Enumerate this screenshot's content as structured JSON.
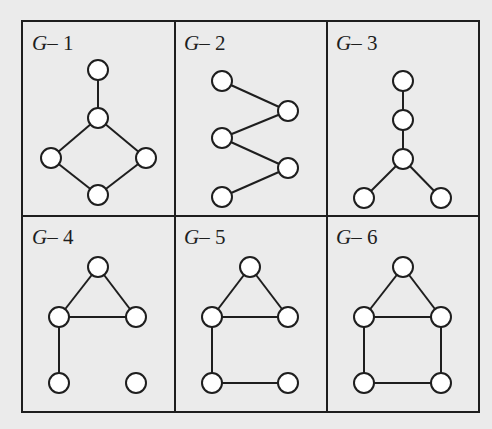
{
  "figure": {
    "grid": {
      "left": 22,
      "right": 479,
      "top": 21,
      "middle": 216,
      "bottom": 412,
      "col_dividers": [
        175,
        327
      ]
    },
    "node_radius": 10,
    "colors": {
      "background": "#ebebeb",
      "stroke": "#1e1e1e",
      "node_fill": "#ffffff"
    },
    "panels": [
      {
        "id": "G-1",
        "prefix": "G",
        "dash": "–",
        "number": "1",
        "label_pos": [
          32,
          50
        ],
        "nodes": [
          [
            98,
            70
          ],
          [
            98,
            118
          ],
          [
            51,
            158
          ],
          [
            146,
            158
          ],
          [
            98,
            195
          ]
        ],
        "edges": [
          [
            0,
            1
          ],
          [
            1,
            2
          ],
          [
            1,
            3
          ],
          [
            2,
            4
          ],
          [
            3,
            4
          ]
        ]
      },
      {
        "id": "G-2",
        "prefix": "G",
        "dash": "–",
        "number": "2",
        "label_pos": [
          184,
          50
        ],
        "nodes": [
          [
            222,
            81
          ],
          [
            288,
            111
          ],
          [
            222,
            138
          ],
          [
            288,
            168
          ],
          [
            222,
            197
          ]
        ],
        "edges": [
          [
            0,
            1
          ],
          [
            1,
            2
          ],
          [
            2,
            3
          ],
          [
            3,
            4
          ]
        ]
      },
      {
        "id": "G-3",
        "prefix": "G",
        "dash": "–",
        "number": "3",
        "label_pos": [
          336,
          50
        ],
        "nodes": [
          [
            403,
            81
          ],
          [
            403,
            120
          ],
          [
            403,
            159
          ],
          [
            364,
            198
          ],
          [
            441,
            198
          ]
        ],
        "edges": [
          [
            0,
            1
          ],
          [
            1,
            2
          ],
          [
            2,
            3
          ],
          [
            2,
            4
          ]
        ]
      },
      {
        "id": "G-4",
        "prefix": "G",
        "dash": "–",
        "number": "4",
        "label_pos": [
          32,
          244
        ],
        "nodes": [
          [
            98,
            267
          ],
          [
            59,
            317
          ],
          [
            136,
            317
          ],
          [
            59,
            383
          ],
          [
            136,
            383
          ]
        ],
        "edges": [
          [
            0,
            1
          ],
          [
            0,
            2
          ],
          [
            1,
            2
          ],
          [
            1,
            3
          ]
        ]
      },
      {
        "id": "G-5",
        "prefix": "G",
        "dash": "–",
        "number": "5",
        "label_pos": [
          184,
          244
        ],
        "nodes": [
          [
            250,
            267
          ],
          [
            212,
            317
          ],
          [
            288,
            317
          ],
          [
            212,
            383
          ],
          [
            288,
            383
          ]
        ],
        "edges": [
          [
            0,
            1
          ],
          [
            0,
            2
          ],
          [
            1,
            2
          ],
          [
            1,
            3
          ],
          [
            3,
            4
          ]
        ]
      },
      {
        "id": "G-6",
        "prefix": "G",
        "dash": "–",
        "number": "6",
        "label_pos": [
          336,
          244
        ],
        "nodes": [
          [
            403,
            267
          ],
          [
            364,
            317
          ],
          [
            441,
            317
          ],
          [
            364,
            383
          ],
          [
            441,
            383
          ]
        ],
        "edges": [
          [
            0,
            1
          ],
          [
            0,
            2
          ],
          [
            1,
            2
          ],
          [
            1,
            3
          ],
          [
            2,
            4
          ],
          [
            3,
            4
          ]
        ]
      }
    ]
  }
}
